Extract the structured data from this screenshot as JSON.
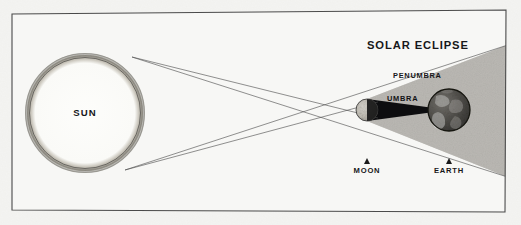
{
  "diagram": {
    "title": "SOLAR ECLIPSE",
    "frame": {
      "border_color": "#4a4a4a",
      "background_color": "#f6f6f4"
    },
    "bodies": [
      {
        "id": "sun",
        "label": "SUN",
        "cx": 85,
        "cy": 113,
        "r": 58,
        "fill": "#fafaf8",
        "rim_color": "#9b988f"
      },
      {
        "id": "moon",
        "label": "MOON",
        "cx": 367,
        "cy": 110,
        "r": 11,
        "fill": "#d7d4cd",
        "rim_color": "#3a3a3a"
      },
      {
        "id": "earth",
        "label": "EARTH",
        "cx": 449,
        "cy": 110,
        "r": 21,
        "fill": "#4a4845",
        "rim_color": "#1d1d1d"
      }
    ],
    "shadow_zones": [
      {
        "id": "penumbra",
        "label": "PENUMBRA",
        "color": "#b8b6b1",
        "description": "gray partial-shadow wedge widening from the moon toward and past the earth"
      },
      {
        "id": "umbra",
        "label": "UMBRA",
        "color": "#0d0d0f",
        "description": "solid black total-shadow cone narrowing from the moon to a point at the earth"
      }
    ],
    "labels": {
      "title": "SOLAR ECLIPSE",
      "sun": "SUN",
      "moon": "MOON",
      "earth": "EARTH",
      "penumbra": "PENUMBRA",
      "umbra": "UMBRA"
    },
    "rays": {
      "count": 4,
      "color": "#4b4b4b",
      "description": "four tangent light rays from the top and bottom limbs of the sun crossing at the moon"
    }
  }
}
